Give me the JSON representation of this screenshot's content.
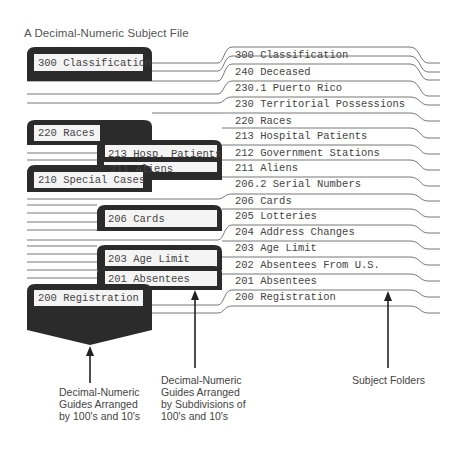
{
  "title": "A Decimal-Numeric Subject File",
  "primary_guides": [
    {
      "label": "300 Classification"
    },
    {
      "label": "220 Races"
    },
    {
      "label": "210 Special Cases"
    },
    {
      "label": "200 Registration"
    }
  ],
  "secondary_guides": [
    {
      "label": "213 Hosp. Patients"
    },
    {
      "label": "211 Aliens"
    },
    {
      "label": "206 Cards"
    },
    {
      "label": "203 Age Limit"
    },
    {
      "label": "201 Absentees"
    }
  ],
  "folders": [
    {
      "label": "300 Classification"
    },
    {
      "label": "240 Deceased"
    },
    {
      "label": "230.1 Puerto Rico"
    },
    {
      "label": "230 Territorial Possessions"
    },
    {
      "label": "220 Races"
    },
    {
      "label": "213 Hospital Patients"
    },
    {
      "label": "212 Government Stations"
    },
    {
      "label": "211 Aliens"
    },
    {
      "label": "206.2 Serial Numbers"
    },
    {
      "label": "206 Cards"
    },
    {
      "label": "205 Lotteries"
    },
    {
      "label": "204 Address Changes"
    },
    {
      "label": "203 Age Limit"
    },
    {
      "label": "202 Absentees From U.S."
    },
    {
      "label": "201 Absentees"
    },
    {
      "label": "200 Registration"
    }
  ],
  "captions": {
    "primary": "Decimal-Numeric Guides Arranged by 100's and 10's",
    "secondary": "Decimal-Numeric Guides Arranged by Subdivisions of 100's and 10's",
    "folders": "Subject Folders"
  },
  "colors": {
    "guide_fill": "#2b2b2b",
    "label_fill": "#f4f4f4",
    "line": "#555555",
    "text": "#444444"
  }
}
